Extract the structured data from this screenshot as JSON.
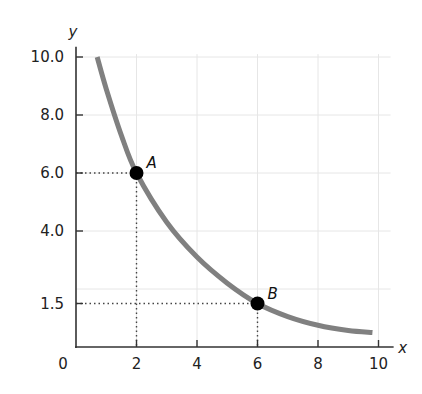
{
  "chart_data": {
    "type": "line",
    "title": "",
    "xlabel": "x",
    "ylabel": "y",
    "xlim": [
      0,
      10
    ],
    "ylim": [
      0,
      10
    ],
    "grid": true,
    "x_ticks": [
      2,
      4,
      6,
      8,
      10
    ],
    "x_tick_labels": [
      "2",
      "4",
      "6",
      "8",
      "10"
    ],
    "y_ticks": [
      1.5,
      4.0,
      6.0,
      8.0,
      10.0
    ],
    "y_tick_labels": [
      "1.5",
      "4.0",
      "6.0",
      "8.0",
      "10.0"
    ],
    "origin_label": "0",
    "series": [
      {
        "name": "curve",
        "color": "#808080",
        "x": [
          0.7,
          1.0,
          1.5,
          2.0,
          3.0,
          4.0,
          5.0,
          6.0,
          7.0,
          8.0,
          9.0,
          9.8
        ],
        "y": [
          10.0,
          8.9,
          7.3,
          6.0,
          4.3,
          3.1,
          2.2,
          1.5,
          1.05,
          0.75,
          0.57,
          0.5
        ]
      }
    ],
    "points": [
      {
        "label": "A",
        "x": 2,
        "y": 6.0
      },
      {
        "label": "B",
        "x": 6,
        "y": 1.5
      }
    ],
    "annotations": [
      "Dotted guide lines from A to x=2 and y=6.0",
      "Dotted guide lines from B to x=6 and y=1.5"
    ]
  },
  "axes": {
    "x_name": "x",
    "y_name": "y",
    "origin": "0"
  },
  "colors": {
    "curve": "#808080",
    "axis": "#333333",
    "grid": "#e6e6e6",
    "point": "#000000",
    "guide": "#444444"
  }
}
